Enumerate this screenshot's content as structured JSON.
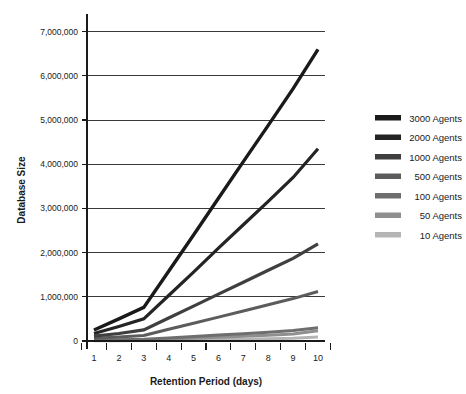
{
  "chart_data": {
    "type": "line",
    "title": "",
    "xlabel": "Retention Period (days)",
    "ylabel": "Database Size",
    "x": [
      1,
      2,
      3,
      4,
      5,
      6,
      7,
      8,
      9,
      10
    ],
    "xlim": [
      1,
      10
    ],
    "ylim": [
      0,
      7400000
    ],
    "grid": true,
    "legend_position": "right",
    "ytick_labels": [
      "7,000,000",
      "6,000,000",
      "5,000,000",
      "4,000,000",
      "3,000,000",
      "2,000,000",
      "1,000,000",
      "0"
    ],
    "ytick_values": [
      7000000,
      6000000,
      5000000,
      4000000,
      3000000,
      2000000,
      1000000,
      0
    ],
    "xtick_labels": [
      "1",
      "2",
      "3",
      "4",
      "5",
      "6",
      "7",
      "8",
      "9",
      "10"
    ],
    "series": [
      {
        "name": "3000 Agents",
        "color": "#1a1a1a",
        "width": 3.4,
        "values": [
          250000,
          500000,
          760000,
          1580000,
          2400000,
          3230000,
          4060000,
          4880000,
          5710000,
          6600000
        ]
      },
      {
        "name": "2000 Agents",
        "color": "#242424",
        "width": 3.2,
        "values": [
          170000,
          330000,
          500000,
          1030000,
          1560000,
          2100000,
          2630000,
          3160000,
          3700000,
          4350000
        ]
      },
      {
        "name": "1000 Agents",
        "color": "#3f3f3f",
        "width": 3.2,
        "values": [
          110000,
          170000,
          250000,
          520000,
          790000,
          1060000,
          1330000,
          1600000,
          1870000,
          2200000
        ]
      },
      {
        "name": "500 Agents",
        "color": "#5c5c5c",
        "width": 3.0,
        "values": [
          60000,
          90000,
          125000,
          265000,
          400000,
          540000,
          680000,
          820000,
          960000,
          1120000
        ]
      },
      {
        "name": "100 Agents",
        "color": "#6e6e6e",
        "width": 3.0,
        "values": [
          20000,
          30000,
          40000,
          70000,
          100000,
          135000,
          165000,
          200000,
          240000,
          300000
        ]
      },
      {
        "name": "50 Agents",
        "color": "#8f8f8f",
        "width": 3.0,
        "values": [
          12000,
          18000,
          25000,
          45000,
          65000,
          85000,
          105000,
          130000,
          160000,
          230000
        ]
      },
      {
        "name": "10 Agents",
        "color": "#b5b5b5",
        "width": 3.0,
        "values": [
          5000,
          8000,
          11000,
          18000,
          26000,
          34000,
          42000,
          52000,
          64000,
          90000
        ]
      }
    ]
  },
  "legend": {
    "items": [
      {
        "label": "3000 Agents",
        "color": "#1a1a1a"
      },
      {
        "label": "2000 Agents",
        "color": "#242424"
      },
      {
        "label": "1000 Agents",
        "color": "#3f3f3f"
      },
      {
        "label": "500 Agents",
        "color": "#5c5c5c"
      },
      {
        "label": "100 Agents",
        "color": "#6e6e6e"
      },
      {
        "label": "50 Agents",
        "color": "#8f8f8f"
      },
      {
        "label": "10 Agents",
        "color": "#b5b5b5"
      }
    ]
  }
}
